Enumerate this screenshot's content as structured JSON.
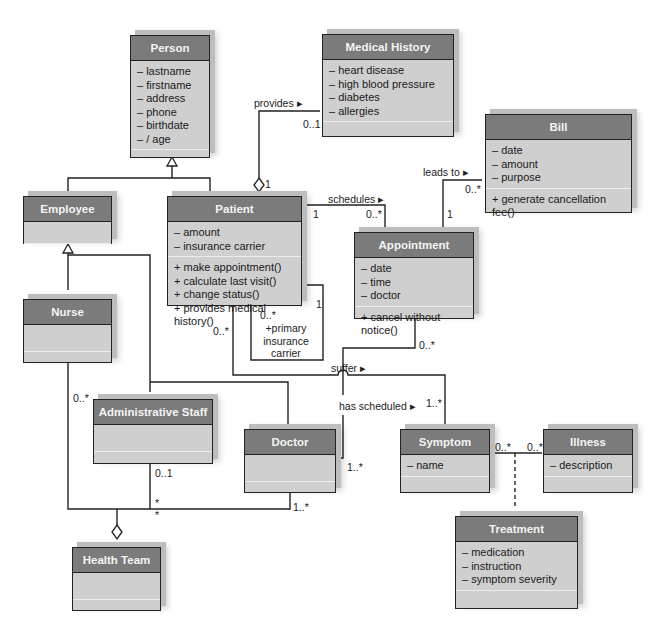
{
  "diagram": {
    "type": "UML class diagram",
    "classes": {
      "person": {
        "name": "Person",
        "attributes": [
          "– lastname",
          "– firstname",
          "– address",
          "– phone",
          "– birthdate",
          "– / age"
        ],
        "operations": []
      },
      "medical_history": {
        "name": "Medical History",
        "attributes": [
          "– heart disease",
          "– high blood pressure",
          "– diabetes",
          "– allergies"
        ],
        "operations": []
      },
      "bill": {
        "name": "Bill",
        "attributes": [
          "– date",
          "– amount",
          "– purpose"
        ],
        "operations": [
          "+ generate cancellation fee()"
        ]
      },
      "employee": {
        "name": "Employee",
        "attributes": [],
        "operations": []
      },
      "patient": {
        "name": "Patient",
        "attributes": [
          "– amount",
          "– insurance carrier"
        ],
        "operations": [
          "+ make appointment()",
          "+ calculate last visit()",
          "+ change status()",
          "+ provides medical history()"
        ]
      },
      "appointment": {
        "name": "Appointment",
        "attributes": [
          "– date",
          "– time",
          "– doctor"
        ],
        "operations": [
          "+ cancel without notice()"
        ]
      },
      "nurse": {
        "name": "Nurse",
        "attributes": [],
        "operations": []
      },
      "administrative_staff": {
        "name": "Administrative Staff",
        "attributes": [],
        "operations": []
      },
      "doctor": {
        "name": "Doctor",
        "attributes": [],
        "operations": []
      },
      "symptom": {
        "name": "Symptom",
        "attributes": [
          "– name"
        ],
        "operations": []
      },
      "illness": {
        "name": "Illness",
        "attributes": [
          "– description"
        ],
        "operations": []
      },
      "treatment": {
        "name": "Treatment",
        "attributes": [
          "– medication",
          "– instruction",
          "– symptom severity"
        ],
        "operations": []
      },
      "health_team": {
        "name": "Health Team",
        "attributes": [],
        "operations": []
      }
    },
    "associations": {
      "provides": {
        "label": "provides ▸",
        "mult_history": "0..1",
        "mult_patient": "1"
      },
      "schedules": {
        "label": "schedules ▸",
        "mult_patient": "1",
        "mult_appointment": "0..*"
      },
      "leads_to": {
        "label": "leads to ▸",
        "mult_bill": "0..*",
        "mult_appointment": "1"
      },
      "primary_insurance": {
        "role_line1": "+primary",
        "role_line2": "insurance",
        "role_line3": "carrier",
        "mult_a": "1",
        "mult_b": "0..*"
      },
      "suffer": {
        "label": "suffer ▸",
        "mult_patient": "0..*",
        "mult_symptom": "1..*"
      },
      "has_scheduled": {
        "label": "has scheduled ▸",
        "mult_appointment": "0..*",
        "mult_doctor": "1..*"
      },
      "symptom_illness": {
        "mult_symptom": "0..*",
        "mult_illness": "0..*"
      },
      "health_team": {
        "mult_nurse": "0..*",
        "mult_admin": "0..1",
        "mult_star1": "*",
        "mult_star2": "*",
        "mult_doctor": "1..*"
      }
    }
  },
  "colors": {
    "header": "#7b7b7b",
    "body": "#cfcfcf",
    "border": "#222222",
    "line": "#222222"
  }
}
